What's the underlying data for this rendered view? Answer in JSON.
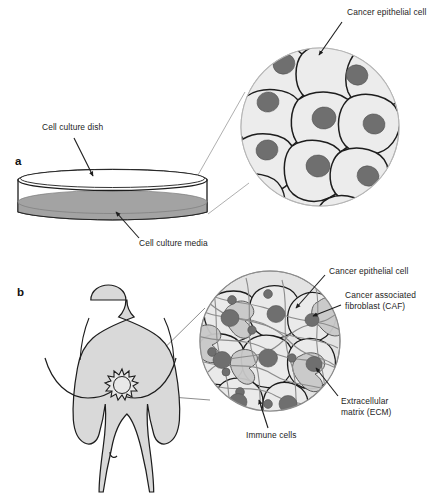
{
  "figure": {
    "panels": [
      {
        "id": "a",
        "letter": "a",
        "name": "cell-culture-panel",
        "description": "Cell culture dish with media, magnified view of cancer epithelial cell monolayer",
        "labels": [
          {
            "id": "cancer-epithelial-cell",
            "text": "Cancer epithelial cell",
            "lines": [
              "Cancer epithelial cell"
            ]
          },
          {
            "id": "cell-culture-dish",
            "text": "Cell culture dish",
            "lines": [
              "Cell culture dish"
            ]
          },
          {
            "id": "cell-culture-media",
            "text": "Cell culture media",
            "lines": [
              "Cell culture media"
            ]
          }
        ]
      },
      {
        "id": "b",
        "letter": "b",
        "name": "in-vivo-panel",
        "description": "Female torso with breast tumour, magnified view of tumour microenvironment",
        "labels": [
          {
            "id": "cancer-epithelial-cell-b",
            "text": "Cancer epithelial cell",
            "lines": [
              "Cancer epithelial cell"
            ]
          },
          {
            "id": "cancer-associated-fibroblast",
            "text": "Cancer associated fibroblast (CAF)",
            "lines": [
              "Cancer associated",
              "fibroblast (CAF)"
            ]
          },
          {
            "id": "extracellular-matrix",
            "text": "Extracellular matrix (ECM)",
            "lines": [
              "Extracellular",
              "matrix (ECM)"
            ]
          },
          {
            "id": "immune-cells",
            "text": "Immune cells",
            "lines": [
              "Immune cells"
            ]
          }
        ]
      }
    ],
    "colors": {
      "outline": "#1d1d1d",
      "cell_fill": "#ececec",
      "nucleus_fill": "#6f6f6f",
      "media_fill": "#a3a3a3",
      "dish_fill": "#ffffff",
      "body_fill": "#d9d9d9",
      "ecm_stroke": "#8c8c8c",
      "caf_fill": "#c9c9c9",
      "leader_line": "#1d1d1d",
      "callout_line": "#9a9a9a",
      "background": "#ffffff"
    },
    "label_text": {
      "cancer_epithelial_cell": "Cancer epithelial cell",
      "cell_culture_dish": "Cell culture dish",
      "cell_culture_media": "Cell culture media",
      "cancer_epithelial_cell_b": "Cancer epithelial cell",
      "cancer_associated_1": "Cancer associated",
      "cancer_associated_2": "fibroblast (CAF)",
      "extracellular_1": "Extracellular",
      "extracellular_2": "matrix (ECM)",
      "immune_cells": "Immune cells",
      "letter_a": "a",
      "letter_b": "b"
    }
  }
}
